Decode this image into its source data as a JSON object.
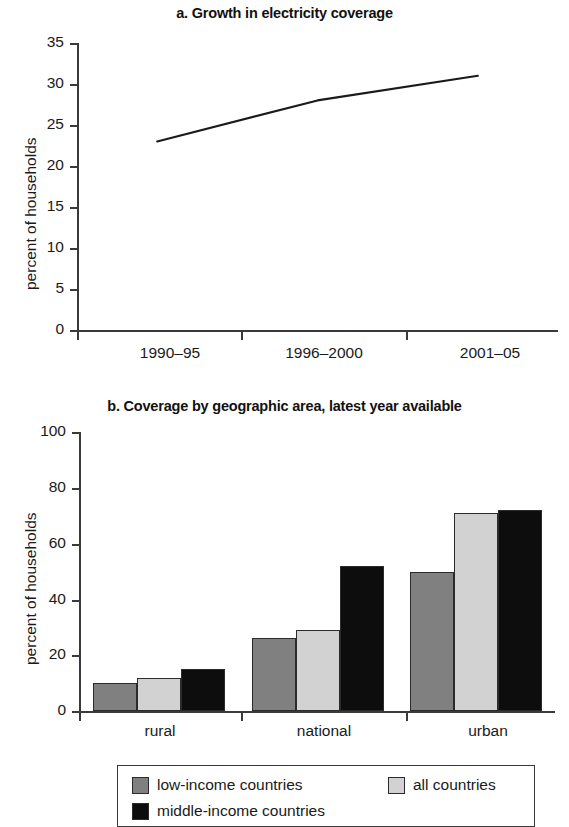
{
  "chart_data": [
    {
      "type": "line",
      "title": "a. Growth in electricity coverage",
      "xlabel": "",
      "ylabel": "percent of households",
      "categories": [
        "1990–95",
        "1996–2000",
        "2001–05"
      ],
      "values": [
        23,
        28,
        31
      ],
      "series": [
        {
          "name": "electricity coverage",
          "values": [
            23,
            28,
            31
          ]
        }
      ],
      "ylim": [
        0,
        35
      ],
      "yticks": [
        0,
        5,
        10,
        15,
        20,
        25,
        30,
        35
      ],
      "ytick_labels": [
        "0",
        "5",
        "10",
        "15",
        "20",
        "25",
        "30",
        "35"
      ],
      "grid": false,
      "legend": "none",
      "line_color": "#1a1a1a"
    },
    {
      "type": "bar",
      "title": "b. Coverage by geographic area, latest year available",
      "xlabel": "",
      "ylabel": "percent of households",
      "categories": [
        "rural",
        "national",
        "urban"
      ],
      "series": [
        {
          "name": "low-income countries",
          "values": [
            10,
            26,
            50
          ],
          "color": "#808080"
        },
        {
          "name": "all countries",
          "values": [
            12,
            29,
            71
          ],
          "color": "#d2d2d2"
        },
        {
          "name": "middle-income countries",
          "values": [
            15,
            52,
            72
          ],
          "color": "#0d0d0d"
        }
      ],
      "ylim": [
        0,
        100
      ],
      "yticks": [
        0,
        20,
        40,
        60,
        80,
        100
      ],
      "ytick_labels": [
        "0",
        "20",
        "40",
        "60",
        "80",
        "100"
      ],
      "grid": false,
      "legend": "bottom"
    }
  ],
  "chart_a": {
    "title": "a. Growth in electricity coverage",
    "ylabel": "percent of households",
    "ytick_labels": [
      "35",
      "30",
      "25",
      "20",
      "15",
      "10",
      "5",
      "0"
    ],
    "xtick_labels": [
      "1990–95",
      "1996–2000",
      "2001–05"
    ]
  },
  "chart_b": {
    "title": "b. Coverage by geographic area, latest year available",
    "ylabel": "percent of households",
    "ytick_labels": [
      "100",
      "80",
      "60",
      "40",
      "20",
      "0"
    ],
    "xtick_labels": [
      "rural",
      "national",
      "urban"
    ],
    "legend": [
      {
        "label": "low-income countries",
        "color": "#808080"
      },
      {
        "label": "all countries",
        "color": "#d2d2d2"
      },
      {
        "label": "middle-income countries",
        "color": "#0d0d0d"
      }
    ]
  }
}
